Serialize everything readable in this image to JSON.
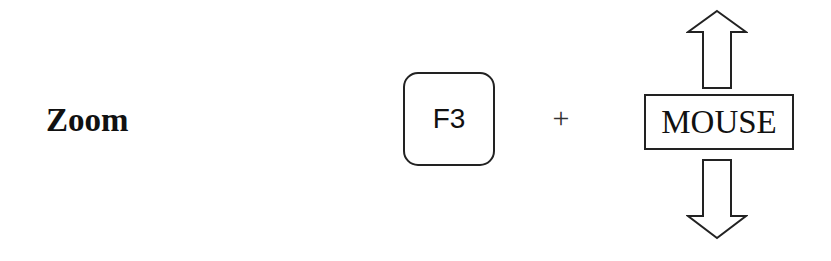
{
  "instruction": {
    "action_label": "Zoom",
    "key_label": "F3",
    "combinator": "+",
    "device_label": "MOUSE",
    "device_motion": {
      "up_arrow": "arrow-up-icon",
      "down_arrow": "arrow-down-icon"
    }
  }
}
